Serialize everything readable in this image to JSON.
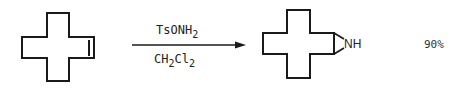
{
  "scheme": {
    "reactant": {
      "name": "cycloalkene (cross-shaped ring with double bond)",
      "has_double_bond": true
    },
    "arrow": {
      "reagent_above": {
        "main": "TsONH",
        "subscript": "2"
      },
      "solvent_below": {
        "parts": [
          {
            "text": "CH",
            "sub": false
          },
          {
            "text": "2",
            "sub": true
          },
          {
            "text": "Cl",
            "sub": false
          },
          {
            "text": "2",
            "sub": true
          }
        ]
      }
    },
    "product": {
      "name": "aziridine-fused ring",
      "heteroatom_label": "NH"
    },
    "yield": "90%"
  },
  "colors": {
    "ink": "#1a1a1a",
    "background": "#ffffff"
  }
}
